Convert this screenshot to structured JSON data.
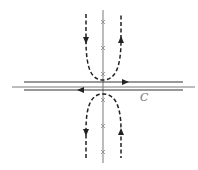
{
  "diagram": {
    "type": "complex-plane contour diagram",
    "contour_label": "C",
    "axes": {
      "real": {
        "x1": 12,
        "x2": 195,
        "y": 87
      },
      "imaginary": {
        "x": 103,
        "y1": 10,
        "y2": 163
      }
    },
    "poles_upper_y": [
      22,
      48,
      74
    ],
    "poles_lower_y": [
      100,
      126,
      152
    ],
    "contour_lines": [
      {
        "name": "upper-line",
        "y": 82,
        "x1": 24,
        "x2": 183,
        "direction": "right"
      },
      {
        "name": "lower-line",
        "y": 90,
        "x1": 24,
        "x2": 183,
        "direction": "left"
      }
    ],
    "deformed_contours": [
      {
        "name": "upper-dashed-u",
        "left_arm_direction": "down",
        "right_arm_direction": "up"
      },
      {
        "name": "lower-dashed-cap",
        "left_arm_direction": "down",
        "right_arm_direction": "up"
      }
    ],
    "colors": {
      "axis": "#7a7a7a",
      "contour": "#333333",
      "dashed": "#222222",
      "label": "#777777"
    }
  }
}
